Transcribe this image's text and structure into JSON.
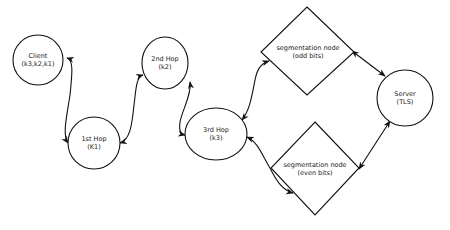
{
  "diagram": {
    "colors": {
      "stroke": "#111111",
      "fill": "#ffffff",
      "text": "#222222"
    },
    "nodes": {
      "client": {
        "shape": "circle",
        "line1": "Client",
        "line2": "(k3,k2,k1)"
      },
      "hop1": {
        "shape": "circle",
        "line1": "1st Hop",
        "line2": "(K1)"
      },
      "hop2": {
        "shape": "circle",
        "line1": "2nd Hop",
        "line2": "(k2)"
      },
      "hop3": {
        "shape": "ellipse",
        "line1": "3rd Hop",
        "line2": "(k3)"
      },
      "seg_odd": {
        "shape": "diamond",
        "line1": "segmentation node",
        "line2": "(odd bits)"
      },
      "seg_even": {
        "shape": "diamond",
        "line1": "segmentation node",
        "line2": "(even bits)"
      },
      "server": {
        "shape": "circle",
        "line1": "Server",
        "line2": "(TLS)"
      }
    },
    "edges": [
      {
        "from": "client",
        "to": "hop1",
        "direction": "bidirectional"
      },
      {
        "from": "hop1",
        "to": "hop2",
        "direction": "bidirectional"
      },
      {
        "from": "hop2",
        "to": "hop3",
        "direction": "bidirectional"
      },
      {
        "from": "hop3",
        "to": "seg_odd",
        "direction": "bidirectional"
      },
      {
        "from": "hop3",
        "to": "seg_even",
        "direction": "bidirectional"
      },
      {
        "from": "seg_odd",
        "to": "server",
        "direction": "bidirectional"
      },
      {
        "from": "seg_even",
        "to": "server",
        "direction": "bidirectional"
      }
    ]
  }
}
